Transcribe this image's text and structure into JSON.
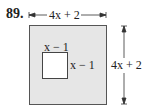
{
  "problem_number": "89.",
  "outer": {
    "width_label": "4x + 2",
    "height_label": "4x + 2",
    "fill": "#e6e6e6",
    "stroke": "#555555"
  },
  "inner": {
    "top_label": "x − 1",
    "right_label": "x − 1",
    "fill": "#ffffff",
    "stroke": "#444444"
  }
}
